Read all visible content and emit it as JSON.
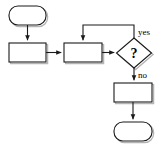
{
  "diagram": {
    "background_color": "#ffffff",
    "stroke_color": "#1a1a1a",
    "shadow_color": "#b4b4b4",
    "label_color": "#000000",
    "nodes": [
      {
        "id": "start",
        "shape": "terminator",
        "label": "",
        "x": 9,
        "y": 6,
        "w": 37,
        "h": 19,
        "rx": 9
      },
      {
        "id": "process-1",
        "shape": "process",
        "label": "",
        "x": 9,
        "y": 43,
        "w": 37,
        "h": 19
      },
      {
        "id": "process-2",
        "shape": "process",
        "label": "",
        "x": 64,
        "y": 43,
        "w": 38,
        "h": 19
      },
      {
        "id": "decision",
        "shape": "diamond",
        "label": "?",
        "cx": 134,
        "cy": 53,
        "w": 35,
        "h": 30
      },
      {
        "id": "process-3",
        "shape": "process",
        "label": "",
        "x": 114,
        "y": 83,
        "w": 38,
        "h": 19
      },
      {
        "id": "end",
        "shape": "terminator",
        "label": "",
        "x": 114,
        "y": 122,
        "w": 38,
        "h": 19,
        "rx": 9
      }
    ],
    "edges": [
      {
        "id": "start-to-process-1",
        "label": "",
        "path": "M 27.5 25 L 27.5 40.5",
        "arrow": true
      },
      {
        "id": "process-1-to-process-2",
        "label": "",
        "path": "M 46 52.5 L 61.5 52.5",
        "arrow": true
      },
      {
        "id": "process-2-to-decision",
        "label": "",
        "path": "M 102 52.5 L 114.5 52.5",
        "arrow": true
      },
      {
        "id": "decision-yes-loop",
        "label": "yes",
        "path": "M 134 38 L 134 25 L 83 25 L 83 40.5",
        "arrow": true
      },
      {
        "id": "decision-no-to-process-3",
        "label": "no",
        "path": "M 134 68 L 134 80.5",
        "arrow": true
      },
      {
        "id": "process-3-to-end",
        "label": "",
        "path": "M 133 102 L 133 119.5",
        "arrow": true
      }
    ],
    "labels": {
      "yes": "yes",
      "no": "no",
      "decision_glyph": "?"
    }
  }
}
